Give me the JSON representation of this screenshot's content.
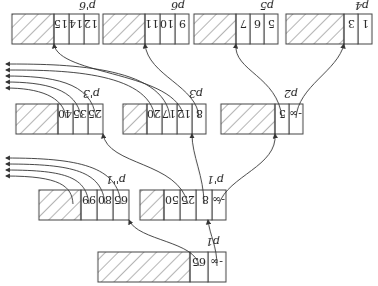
{
  "diagram": {
    "orientation": "rotated-180",
    "nodes": [
      {
        "id": "p1",
        "label": "p1",
        "keys": [
          "-∞",
          "65"
        ]
      },
      {
        "id": "p1prime",
        "label": "p'1",
        "keys": [
          "-∞",
          "8",
          "25",
          "50"
        ]
      },
      {
        "id": "p1doubleprime",
        "label": "p''1",
        "keys": [
          "65",
          "80",
          "99"
        ]
      },
      {
        "id": "p2",
        "label": "p2",
        "keys": [
          "-∞",
          "5"
        ]
      },
      {
        "id": "p3",
        "label": "p3",
        "keys": [
          "8",
          "12",
          "17",
          "20"
        ]
      },
      {
        "id": "p3prime",
        "label": "p'3",
        "keys": [
          "25",
          "35",
          "40"
        ]
      },
      {
        "id": "p4",
        "label": "p4",
        "keys": [
          "1",
          "3"
        ]
      },
      {
        "id": "p5",
        "label": "p5",
        "keys": [
          "5",
          "6",
          "7"
        ]
      },
      {
        "id": "p6",
        "label": "p6",
        "keys": [
          "9",
          "10",
          "11"
        ]
      },
      {
        "id": "p6prime",
        "label": "p'6",
        "keys": [
          "12",
          "14",
          "15"
        ]
      }
    ],
    "edges": [
      {
        "from": "p1",
        "to": "p1prime"
      },
      {
        "from": "p1",
        "to": "p1doubleprime"
      },
      {
        "from": "p1prime",
        "to": "p2"
      },
      {
        "from": "p1prime",
        "to": "p3"
      },
      {
        "from": "p1prime",
        "to": "p3prime"
      },
      {
        "from": "p2",
        "to": "p4"
      },
      {
        "from": "p2",
        "to": "p5"
      },
      {
        "from": "p3",
        "to": "p6"
      },
      {
        "from": "p3",
        "to": "p6prime"
      }
    ]
  }
}
